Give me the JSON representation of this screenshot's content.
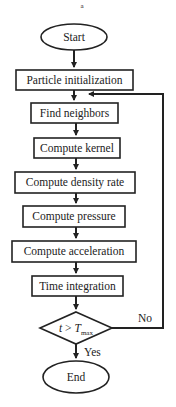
{
  "diagram": {
    "top_mark": "a",
    "nodes": {
      "start": "Start",
      "init": "Particle initialization",
      "neighbors": "Find neighbors",
      "kernel": "Compute kernel",
      "density": "Compute density rate",
      "pressure": "Compute pressure",
      "acceleration": "Compute acceleration",
      "integration": "Time integration",
      "decision_t": "t",
      "decision_op": " > ",
      "decision_T": "T",
      "decision_sub": "max",
      "end": "End"
    },
    "edges": {
      "yes_label": "Yes",
      "no_label": "No"
    },
    "colors": {
      "stroke": "#222222",
      "fill": "#ffffff"
    }
  }
}
